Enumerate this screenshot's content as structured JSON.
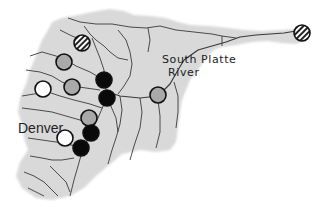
{
  "map": {
    "title": "South Platte River Basin sampling sites",
    "river_label_line1": "South Platte",
    "river_label_line2": "River",
    "city_label": "Denver",
    "colors": {
      "basin_fill": "#d9d9d9",
      "river_stroke": "#3a3a3a",
      "site_outline": "#111111",
      "site_gray": "#a9a9a9",
      "site_white": "#ffffff",
      "site_black": "#0a0a0a"
    },
    "site_categories": [
      "hatched",
      "gray",
      "white",
      "black"
    ],
    "sites": [
      {
        "category": "hatched"
      },
      {
        "category": "hatched"
      },
      {
        "category": "gray"
      },
      {
        "category": "gray"
      },
      {
        "category": "gray"
      },
      {
        "category": "gray"
      },
      {
        "category": "white"
      },
      {
        "category": "white"
      },
      {
        "category": "black"
      },
      {
        "category": "black"
      },
      {
        "category": "black"
      },
      {
        "category": "black"
      }
    ]
  }
}
